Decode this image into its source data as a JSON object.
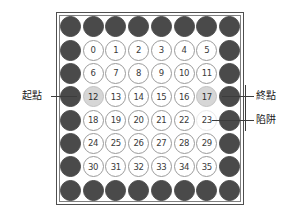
{
  "board": {
    "rows": 8,
    "cols": 8,
    "description": "8x8 grid board with wall border and numbered 6x6 interior",
    "colors": {
      "wall": "#4a4a4a",
      "open": "#ffffff",
      "open_border": "#9a9a9a",
      "highlight": "#d6d6d6",
      "frame_outer": "#4f4f4f",
      "frame_inner": "#808080",
      "text": "#3a3a3a",
      "leader_line": "#3c3c3c"
    },
    "cells": [
      [
        {
          "kind": "wall",
          "label": ""
        },
        {
          "kind": "wall",
          "label": ""
        },
        {
          "kind": "wall",
          "label": ""
        },
        {
          "kind": "wall",
          "label": ""
        },
        {
          "kind": "wall",
          "label": ""
        },
        {
          "kind": "wall",
          "label": ""
        },
        {
          "kind": "wall",
          "label": ""
        },
        {
          "kind": "wall",
          "label": ""
        }
      ],
      [
        {
          "kind": "wall",
          "label": ""
        },
        {
          "kind": "open",
          "label": "0"
        },
        {
          "kind": "open",
          "label": "1"
        },
        {
          "kind": "open",
          "label": "2"
        },
        {
          "kind": "open",
          "label": "3"
        },
        {
          "kind": "open",
          "label": "4"
        },
        {
          "kind": "open",
          "label": "5"
        },
        {
          "kind": "wall",
          "label": ""
        }
      ],
      [
        {
          "kind": "wall",
          "label": ""
        },
        {
          "kind": "open",
          "label": "6"
        },
        {
          "kind": "open",
          "label": "7"
        },
        {
          "kind": "open",
          "label": "8"
        },
        {
          "kind": "open",
          "label": "9"
        },
        {
          "kind": "open",
          "label": "10"
        },
        {
          "kind": "open",
          "label": "11"
        },
        {
          "kind": "wall",
          "label": ""
        }
      ],
      [
        {
          "kind": "wall",
          "label": ""
        },
        {
          "kind": "mark",
          "label": "12"
        },
        {
          "kind": "open",
          "label": "13"
        },
        {
          "kind": "open",
          "label": "14"
        },
        {
          "kind": "open",
          "label": "15"
        },
        {
          "kind": "open",
          "label": "16"
        },
        {
          "kind": "mark",
          "label": "17"
        },
        {
          "kind": "wall",
          "label": ""
        }
      ],
      [
        {
          "kind": "wall",
          "label": ""
        },
        {
          "kind": "open",
          "label": "18"
        },
        {
          "kind": "open",
          "label": "19"
        },
        {
          "kind": "open",
          "label": "20"
        },
        {
          "kind": "open",
          "label": "21"
        },
        {
          "kind": "open",
          "label": "22"
        },
        {
          "kind": "faint",
          "label": "23"
        },
        {
          "kind": "wall",
          "label": ""
        }
      ],
      [
        {
          "kind": "wall",
          "label": ""
        },
        {
          "kind": "open",
          "label": "24"
        },
        {
          "kind": "open",
          "label": "25"
        },
        {
          "kind": "open",
          "label": "26"
        },
        {
          "kind": "open",
          "label": "27"
        },
        {
          "kind": "open",
          "label": "28"
        },
        {
          "kind": "open",
          "label": "29"
        },
        {
          "kind": "wall",
          "label": ""
        }
      ],
      [
        {
          "kind": "wall",
          "label": ""
        },
        {
          "kind": "open",
          "label": "30"
        },
        {
          "kind": "open",
          "label": "31"
        },
        {
          "kind": "open",
          "label": "32"
        },
        {
          "kind": "open",
          "label": "33"
        },
        {
          "kind": "open",
          "label": "34"
        },
        {
          "kind": "open",
          "label": "35"
        },
        {
          "kind": "wall",
          "label": ""
        }
      ],
      [
        {
          "kind": "wall",
          "label": ""
        },
        {
          "kind": "wall",
          "label": ""
        },
        {
          "kind": "wall",
          "label": ""
        },
        {
          "kind": "wall",
          "label": ""
        },
        {
          "kind": "wall",
          "label": ""
        },
        {
          "kind": "wall",
          "label": ""
        },
        {
          "kind": "wall",
          "label": ""
        },
        {
          "kind": "wall",
          "label": ""
        }
      ]
    ]
  },
  "annotations": {
    "start": {
      "label": "起點",
      "target_cell": "12",
      "side": "left"
    },
    "end": {
      "label": "終點",
      "target_cell": "17",
      "side": "right"
    },
    "trap": {
      "label": "陷阱",
      "target_cell": "23",
      "side": "right"
    }
  }
}
